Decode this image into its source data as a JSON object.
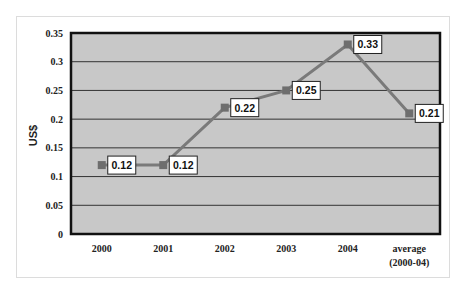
{
  "chart_data": {
    "type": "line",
    "title": "",
    "xlabel": "",
    "ylabel": "US$",
    "categories": [
      "2000",
      "2001",
      "2002",
      "2003",
      "2004",
      "average (2000-04)"
    ],
    "category_lines": [
      [
        "2000"
      ],
      [
        "2001"
      ],
      [
        "2002"
      ],
      [
        "2003"
      ],
      [
        "2004"
      ],
      [
        "average",
        "(2000-04)"
      ]
    ],
    "series": [
      {
        "name": "US$",
        "values": [
          0.12,
          0.12,
          0.22,
          0.25,
          0.33,
          0.21
        ],
        "labels": [
          "0.12",
          "0.12",
          "0.22",
          "0.25",
          "0.33",
          "0.21"
        ]
      }
    ],
    "ylim": [
      0,
      0.35
    ],
    "yticks": [
      0,
      0.05,
      0.1,
      0.15,
      0.2,
      0.25,
      0.3,
      0.35
    ],
    "ytick_labels": [
      "0",
      "0.05",
      "0.1",
      "0.15",
      "0.2",
      "0.25",
      "0.3",
      "0.35"
    ],
    "grid": true,
    "legend": "none",
    "colors": {
      "plot_bg": "#c8c8c8",
      "line": "#7a7a7a",
      "marker": "#6e6e6e",
      "grid": "#333333",
      "border": "#111111"
    }
  }
}
